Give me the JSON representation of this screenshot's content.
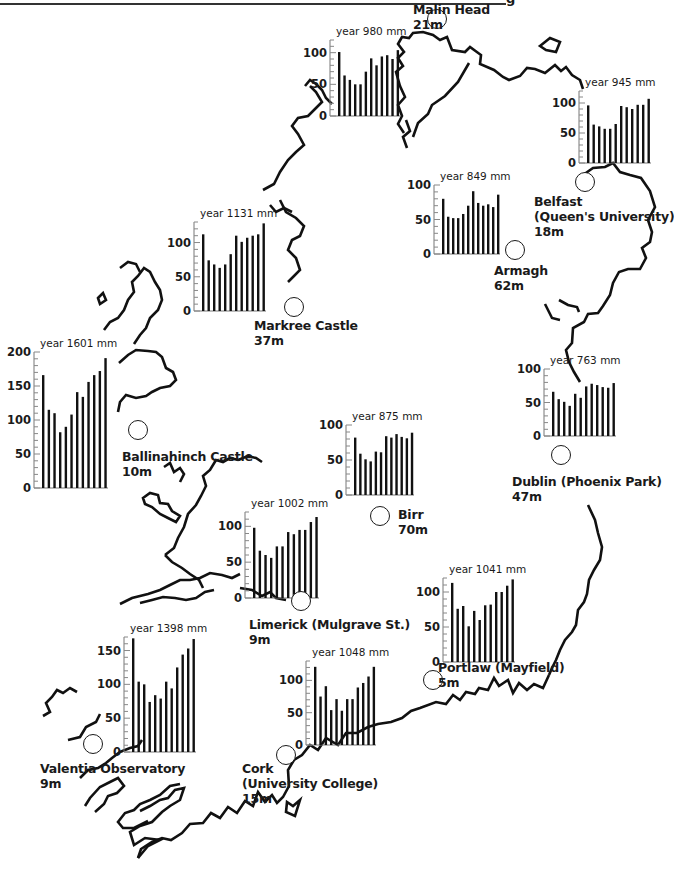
{
  "page": {
    "header_fragment": "g",
    "rule_visible": true
  },
  "chart_data": [
    {
      "type": "bar",
      "title": "year 980 mm",
      "station": "Malin Head",
      "elevation": "21m",
      "categories": [
        "J",
        "F",
        "M",
        "A",
        "M",
        "J",
        "J",
        "A",
        "S",
        "O",
        "N",
        "D"
      ],
      "values": [
        101,
        64,
        57,
        50,
        50,
        70,
        91,
        80,
        94,
        96,
        90,
        104
      ],
      "ylim": [
        0,
        120
      ],
      "yticks": [
        0,
        50,
        100
      ],
      "xlabel": "",
      "ylabel": "mm",
      "grid": false
    },
    {
      "type": "bar",
      "title": "year 945 mm",
      "station": "Belfast (Queen's University)",
      "elevation": "18m",
      "categories": [
        "J",
        "F",
        "M",
        "A",
        "M",
        "J",
        "J",
        "A",
        "S",
        "O",
        "N",
        "D"
      ],
      "values": [
        96,
        64,
        61,
        57,
        57,
        65,
        95,
        93,
        90,
        97,
        97,
        107
      ],
      "ylim": [
        0,
        120
      ],
      "yticks": [
        0,
        50,
        100
      ],
      "xlabel": "",
      "ylabel": "mm",
      "grid": false
    },
    {
      "type": "bar",
      "title": "year 849 mm",
      "station": "Armagh",
      "elevation": "62m",
      "categories": [
        "J",
        "F",
        "M",
        "A",
        "M",
        "J",
        "J",
        "A",
        "S",
        "O",
        "N",
        "D"
      ],
      "values": [
        80,
        54,
        52,
        52,
        58,
        70,
        91,
        74,
        70,
        72,
        68,
        86
      ],
      "ylim": [
        0,
        100
      ],
      "yticks": [
        0,
        50,
        100
      ],
      "xlabel": "",
      "ylabel": "mm",
      "grid": false
    },
    {
      "type": "bar",
      "title": "year 1131 mm",
      "station": "Markree Castle",
      "elevation": "37m",
      "categories": [
        "J",
        "F",
        "M",
        "A",
        "M",
        "J",
        "J",
        "A",
        "S",
        "O",
        "N",
        "D"
      ],
      "values": [
        112,
        74,
        68,
        63,
        68,
        83,
        110,
        101,
        107,
        110,
        112,
        128
      ],
      "ylim": [
        0,
        130
      ],
      "yticks": [
        0,
        50,
        100
      ],
      "xlabel": "",
      "ylabel": "mm",
      "grid": false
    },
    {
      "type": "bar",
      "title": "year 1601 mm",
      "station": "Ballinahinch Castle",
      "elevation": "10m",
      "categories": [
        "J",
        "F",
        "M",
        "A",
        "M",
        "J",
        "J",
        "A",
        "S",
        "O",
        "N",
        "D"
      ],
      "values": [
        166,
        115,
        110,
        82,
        90,
        108,
        141,
        134,
        156,
        166,
        172,
        191
      ],
      "ylim": [
        0,
        200
      ],
      "yticks": [
        0,
        50,
        100,
        150,
        200
      ],
      "xlabel": "",
      "ylabel": "mm",
      "grid": false
    },
    {
      "type": "bar",
      "title": "year 875 mm",
      "station": "Birr",
      "elevation": "70m",
      "categories": [
        "J",
        "F",
        "M",
        "A",
        "M",
        "J",
        "J",
        "A",
        "S",
        "O",
        "N",
        "D"
      ],
      "values": [
        82,
        59,
        51,
        48,
        62,
        61,
        84,
        82,
        87,
        83,
        81,
        89
      ],
      "ylim": [
        0,
        100
      ],
      "yticks": [
        0,
        50,
        100
      ],
      "xlabel": "",
      "ylabel": "mm",
      "grid": false
    },
    {
      "type": "bar",
      "title": "year 763 mm",
      "station": "Dublin (Phoenix Park)",
      "elevation": "47m",
      "categories": [
        "J",
        "F",
        "M",
        "A",
        "M",
        "J",
        "J",
        "A",
        "S",
        "O",
        "N",
        "D"
      ],
      "values": [
        66,
        55,
        51,
        45,
        63,
        57,
        74,
        78,
        76,
        73,
        72,
        79
      ],
      "ylim": [
        0,
        100
      ],
      "yticks": [
        0,
        50,
        100
      ],
      "xlabel": "",
      "ylabel": "mm",
      "grid": false
    },
    {
      "type": "bar",
      "title": "year 1002 mm",
      "station": "Limerick (Mulgrave St.)",
      "elevation": "9m",
      "categories": [
        "J",
        "F",
        "M",
        "A",
        "M",
        "J",
        "J",
        "A",
        "S",
        "O",
        "N",
        "D"
      ],
      "values": [
        98,
        66,
        60,
        56,
        72,
        72,
        92,
        89,
        95,
        95,
        106,
        113
      ],
      "ylim": [
        0,
        120
      ],
      "yticks": [
        0,
        50,
        100
      ],
      "xlabel": "",
      "ylabel": "mm",
      "grid": false
    },
    {
      "type": "bar",
      "title": "year 1041 mm",
      "station": "Portlaw (Mayfield)",
      "elevation": "5m",
      "categories": [
        "J",
        "F",
        "M",
        "A",
        "M",
        "J",
        "J",
        "A",
        "S",
        "O",
        "N",
        "D"
      ],
      "values": [
        113,
        76,
        80,
        51,
        73,
        60,
        81,
        82,
        100,
        100,
        109,
        118
      ],
      "ylim": [
        0,
        120
      ],
      "yticks": [
        0,
        50,
        100
      ],
      "xlabel": "",
      "ylabel": "mm",
      "grid": false
    },
    {
      "type": "bar",
      "title": "year 1048 mm",
      "station": "Cork (University College)",
      "elevation": "15m",
      "categories": [
        "J",
        "F",
        "M",
        "A",
        "M",
        "J",
        "J",
        "A",
        "S",
        "O",
        "N",
        "D"
      ],
      "values": [
        121,
        75,
        91,
        54,
        71,
        53,
        71,
        71,
        89,
        96,
        106,
        121
      ],
      "ylim": [
        0,
        130
      ],
      "yticks": [
        0,
        50,
        100
      ],
      "xlabel": "",
      "ylabel": "mm",
      "grid": false
    },
    {
      "type": "bar",
      "title": "year 1398 mm",
      "station": "Valentia Observatory",
      "elevation": "9m",
      "categories": [
        "J",
        "F",
        "M",
        "A",
        "M",
        "J",
        "J",
        "A",
        "S",
        "O",
        "N",
        "D"
      ],
      "values": [
        168,
        104,
        100,
        74,
        84,
        79,
        104,
        94,
        125,
        144,
        153,
        167
      ],
      "ylim": [
        0,
        170
      ],
      "yticks": [
        0,
        50,
        100,
        150
      ],
      "xlabel": "",
      "ylabel": "mm",
      "grid": false
    }
  ],
  "layout": [
    {
      "chart": {
        "x": 330,
        "y": 40,
        "w": 70,
        "h": 76,
        "ymax": 120
      },
      "label": {
        "x": 413,
        "y": 2,
        "lines": [
          "Malin Head",
          "21m"
        ]
      },
      "marker": {
        "x": 427,
        "y": 9
      }
    },
    {
      "chart": {
        "x": 579,
        "y": 91,
        "w": 72,
        "h": 72,
        "ymax": 120
      },
      "label": {
        "x": 534,
        "y": 194,
        "lines": [
          "Belfast",
          "(Queen's University)",
          "18m"
        ]
      },
      "marker": {
        "x": 575,
        "y": 172
      }
    },
    {
      "chart": {
        "x": 434,
        "y": 185,
        "w": 66,
        "h": 69,
        "ymax": 100
      },
      "label": {
        "x": 494,
        "y": 263,
        "lines": [
          "Armagh",
          "62m"
        ]
      },
      "marker": {
        "x": 505,
        "y": 240
      }
    },
    {
      "chart": {
        "x": 194,
        "y": 222,
        "w": 72,
        "h": 89,
        "ymax": 130
      },
      "label": {
        "x": 254,
        "y": 318,
        "lines": [
          "Markree Castle",
          "37m"
        ]
      },
      "marker": {
        "x": 284,
        "y": 297
      }
    },
    {
      "chart": {
        "x": 34,
        "y": 352,
        "w": 74,
        "h": 136,
        "ymax": 200
      },
      "label": {
        "x": 122,
        "y": 449,
        "lines": [
          "Ballinahinch Castle",
          "10m"
        ]
      },
      "marker": {
        "x": 128,
        "y": 420
      }
    },
    {
      "chart": {
        "x": 346,
        "y": 425,
        "w": 68,
        "h": 70,
        "ymax": 100
      },
      "label": {
        "x": 398,
        "y": 507,
        "lines": [
          "Birr",
          "70m"
        ]
      },
      "marker": {
        "x": 370,
        "y": 506
      }
    },
    {
      "chart": {
        "x": 544,
        "y": 369,
        "w": 72,
        "h": 67,
        "ymax": 100
      },
      "label": {
        "x": 512,
        "y": 474,
        "lines": [
          "Dublin (Phoenix Park)",
          "47m"
        ]
      },
      "marker": {
        "x": 551,
        "y": 445
      }
    },
    {
      "chart": {
        "x": 245,
        "y": 512,
        "w": 74,
        "h": 86,
        "ymax": 120
      },
      "label": {
        "x": 249,
        "y": 617,
        "lines": [
          "Limerick (Mulgrave St.)",
          "9m"
        ]
      },
      "marker": {
        "x": 291,
        "y": 591
      }
    },
    {
      "chart": {
        "x": 443,
        "y": 578,
        "w": 72,
        "h": 84,
        "ymax": 120
      },
      "label": {
        "x": 438,
        "y": 660,
        "lines": [
          "Portlaw (Mayfield)",
          "5m"
        ]
      },
      "marker": {
        "x": 423,
        "y": 670
      }
    },
    {
      "chart": {
        "x": 306,
        "y": 661,
        "w": 70,
        "h": 84,
        "ymax": 130
      },
      "label": {
        "x": 242,
        "y": 761,
        "lines": [
          "Cork",
          "(University College)",
          "15m"
        ]
      },
      "marker": {
        "x": 276,
        "y": 745
      }
    },
    {
      "chart": {
        "x": 124,
        "y": 637,
        "w": 72,
        "h": 115,
        "ymax": 170
      },
      "label": {
        "x": 40,
        "y": 761,
        "lines": [
          "Valentia Observatory",
          "9m"
        ]
      },
      "marker": {
        "x": 83,
        "y": 734
      }
    }
  ],
  "coastline": {
    "stroke": "#111111",
    "paths": [
      "M404,133 L398,124 L402,116 L398,105 L405,97 L400,86 L396,72 L403,66 L398,58 L404,52 L398,44 L402,37 L409,38 L413,33 L423,32 L433,35 L440,40 L447,37 L452,50 L465,52 L470,47 L481,55 L480,64 L494,70 L503,77 L509,80 L520,76 L527,68 L535,69 L545,73 L555,65 L561,71 L566,67 L572,75 L580,80 L583,89",
      "M469,63 L458,82 L445,96 L432,105 L428,114 L418,123 L413,137",
      "M407,148 L403,137 L410,131 L406,120",
      "M540,46 L550,38 L560,42 L556,52 L546,50 Z",
      "M583,175 L593,168 L605,167 L613,163 L620,172 L630,175 L641,178 L650,191 L655,207 L648,220 L652,232 L650,242 L642,248 L646,258 L640,269 L628,269 L619,272 L613,283 L610,295 L603,306 L598,313 L588,314 L584,322 L573,328 L572,343 L566,350 L569,362 L574,372 L580,382",
      "M559,300 L568,305 L577,307 L579,312",
      "M545,304 L552,318 L560,320",
      "M588,505 L595,520 L598,533 L602,547 L600,560 L594,570 L589,580 L587,594 L584,602 L578,610 L576,625 L572,632 L565,640 L560,650 L556,660 L552,668 L549,675",
      "M549,675 L543,688 L534,684 L527,690 L519,683 L513,693 L508,680 L499,686 L494,678 L488,690 L479,688 L475,694 L466,692 L460,700 L453,695 L446,704 L436,702 L420,708 L411,711 L402,718 L391,722 L378,724 L368,727 L357,733 L346,733 L338,745 L326,738 L318,750 L310,745 L302,755 L294,760 L288,770 L289,786 L283,797 L277,803 L272,795 L265,802 L258,792 L253,806 L245,801 L237,813 L228,807 L220,818 L211,813 L203,823 L190,824 L182,833 L171,840 L162,838 L152,842 L141,849 L138,858",
      "M300,800 L293,806 L287,802 L286,812 L295,816 Z",
      "M138,858 L148,846 L160,840 L145,838 L134,845 L130,832 L140,826 L152,822 L162,812 L170,806 L180,800 L184,788 L175,790 L168,798 L160,800 L150,806 L140,811",
      "M148,821 L134,828 L123,828 L118,822 L125,813 L134,810 L140,804 L150,800 L160,795 L170,786 L180,784",
      "M95,812 L104,804 L108,796 L117,793 L124,786 L118,778 L110,782 L100,787 L90,798 L85,806",
      "M80,778 L88,770 L98,768 L106,763 L112,758 L120,752 L130,748 L138,746 L142,740",
      "M43,716 L50,712 L46,703 L52,697 L57,690 L63,693 L70,688 L77,692",
      "M68,740 L80,737 L86,727 L96,722 L100,714",
      "M120,604 L132,598 L148,594 L160,590 L170,585 L180,580 L190,580 L200,578 L210,573 L222,575 L232,578 L240,574",
      "M140,603 L152,600 L163,597 L175,598 L186,600 L196,598 L205,592 L214,590",
      "M240,588 L252,590 L262,596 L270,592 L276,598 L286,600",
      "M165,555 L174,548 L178,538 L184,527 L188,514 L196,505 L201,496 L206,486 L203,476 L210,470 L216,460 L223,462 L230,458 L238,460 L248,456 L256,458 L262,462",
      "M165,555 L172,562 L182,568 L190,574 L199,580 L203,588",
      "M164,467 L170,463 L174,472 L180,468 L184,474 L180,482",
      "M143,498 L150,493 L158,495 L160,503 L168,504 L172,511 L180,516 L176,522 L168,518 L160,514 L152,507 L145,504 Z",
      "M119,363 L128,355 L136,350 L148,351 L156,352 L162,357 L166,368 L173,372 L176,380 L170,386 L160,388 L152,392 L146,396 L136,398 L126,395 L120,402 L118,412",
      "M104,330 L110,322 L118,318 L124,310 L128,300 L134,292 L132,282 L138,276 L144,268 L150,272 L155,282 L160,290 L162,300 L158,310 L150,318 L146,328 L140,335 L134,344",
      "M120,268 L128,262 L136,264 L140,272",
      "M98,298 L103,293 L106,300 L100,304 Z",
      "M263,190 L274,184 L280,172 L288,160 L296,152 L304,145 L298,134 L292,126 L298,118 L308,116 L314,110 L322,102 L316,92 L310,86",
      "M280,200 L286,212 L296,218 L304,226 L300,236 L292,240 L288,250 L296,258 L300,270 L294,276 L288,282",
      "M270,205 L276,212 L284,208 L292,212",
      "M305,86 L310,80 L316,84 L322,90 L326,98 L332,104"
    ]
  }
}
